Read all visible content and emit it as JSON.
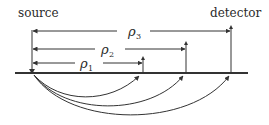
{
  "labels": {
    "source": "source",
    "detector": "detector"
  },
  "distances": [
    {
      "symbol": "ρ",
      "subscript": "1"
    },
    {
      "symbol": "ρ",
      "subscript": "2"
    },
    {
      "symbol": "ρ",
      "subscript": "3"
    }
  ],
  "colors": {
    "ink": "#333333",
    "background": "#ffffff"
  }
}
